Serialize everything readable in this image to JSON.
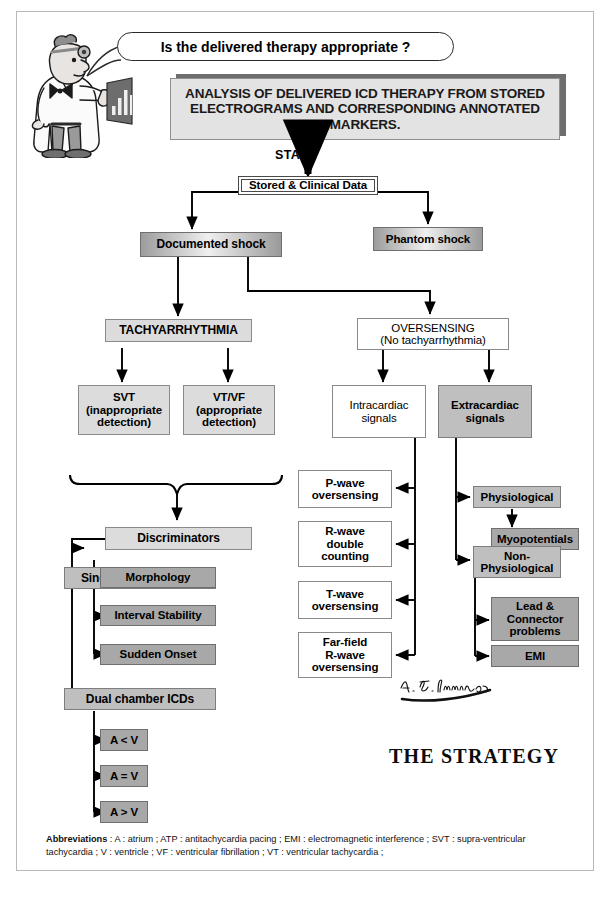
{
  "page": {
    "title_banner": "ANALYSIS OF DELIVERED ICD THERAPY FROM STORED ELECTROGRAMS AND CORRESPONDING ANNOTATED MARKERS.",
    "speech_bubble": "Is the delivered therapy appropriate ?",
    "start_label": "START",
    "strategy_label": "THE STRATEGY",
    "signature": "A. F. Sinnaeve"
  },
  "nodes": {
    "stored_clinical_data": "Stored & Clinical Data",
    "phantom_shock": "Phantom shock",
    "documented_shock": "Documented shock",
    "tachyarrhythmia": "TACHYARRHYTHMIA",
    "svt": "SVT\n(inappropriate\ndetection)",
    "vtvf": "VT/VF\n(appropriate\ndetection)",
    "discriminators": "Discriminators",
    "single_chamber": "Single chamber ICDs",
    "morphology": "Morphology",
    "interval_stability": "Interval Stability",
    "sudden_onset": "Sudden Onset",
    "dual_chamber": "Dual chamber ICDs",
    "a_lt_v": "A < V",
    "a_eq_v": "A = V",
    "a_gt_v": "A > V",
    "oversensing": "OVERSENSING\n(No tachyarrhythmia)",
    "intracardiac": "Intracardiac\nsignals",
    "extracardiac": "Extracardiac\nsignals",
    "p_wave": "P-wave\noversensing",
    "r_wave_double": "R-wave\ndouble\ncounting",
    "t_wave": "T-wave\noversensing",
    "far_field": "Far-field\nR-wave\noversensing",
    "physiological": "Physiological",
    "myopotentials": "Myopotentials",
    "non_physiological": "Non-\nPhysiological",
    "lead_connector": "Lead &\nConnector\nproblems",
    "emi": "EMI"
  },
  "abbreviations": {
    "heading": "Abbreviations",
    "body": " : A : atrium ; ATP : antitachycardia pacing ; EMI : electromagnetic interference ; SVT : supra-ventricular tachycardia ; V : ventricle ; VF : ventricular fibrillation ; VT : ventricular tachycardia ;"
  },
  "colors": {
    "white_box": "#ffffff",
    "light_gray_box": "#dcdcdc",
    "mid_gray_box": "#bfbfbf",
    "dark_gray_box": "#a8a8a8",
    "banner_bg": "#e3e3e3",
    "line": "#000000"
  }
}
